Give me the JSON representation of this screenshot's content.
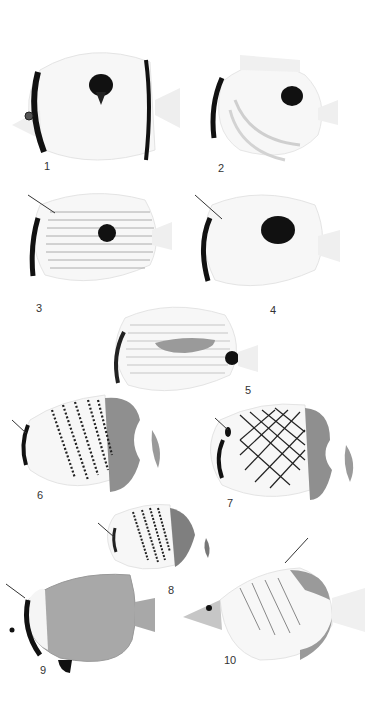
{
  "plate": {
    "background": "#ffffff",
    "figures": [
      {
        "number": "1",
        "label_pos": [
          45,
          168
        ],
        "pattern": "white body, black eye bar, black teardrop spot mid-dorsal, black posterior margin"
      },
      {
        "number": "2",
        "label_pos": [
          220,
          170
        ],
        "pattern": "white body, black eye bar, large black ocellus, two curved grey bands"
      },
      {
        "number": "3",
        "label_pos": [
          37,
          310
        ],
        "pattern": "fine horizontal dark lines, black eye bar, black spot upper rear"
      },
      {
        "number": "4",
        "label_pos": [
          272,
          312
        ],
        "pattern": "white body, black eye bar, large black spot"
      },
      {
        "number": "5",
        "label_pos": [
          247,
          392
        ],
        "pattern": "horizontal lines, grey mid-lateral bar, black spot on caudal peduncle"
      },
      {
        "number": "6",
        "label_pos": [
          38,
          497
        ],
        "pattern": "diagonal dotted black bands, grey posterior fins"
      },
      {
        "number": "7",
        "label_pos": [
          228,
          505
        ],
        "pattern": "black crosshatch net pattern, grey posterior"
      },
      {
        "number": "8",
        "label_pos": [
          169,
          592
        ],
        "pattern": "small fish, diagonal dotted bands, grey posterior"
      },
      {
        "number": "9",
        "label_pos": [
          41,
          672
        ],
        "pattern": "grey body, black eye bar, white band, black pelvic fin"
      },
      {
        "number": "10",
        "label_pos": [
          227,
          662
        ],
        "pattern": "white body, thin diagonal lines, grey margins, long snout"
      }
    ]
  },
  "colors": {
    "ink": "#111111",
    "grey_fin": "#8a8a8a",
    "light_grey": "#d8d8d8",
    "body_white": "#f6f6f6",
    "grey_body": "#a8a8a8"
  }
}
